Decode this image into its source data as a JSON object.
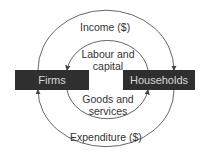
{
  "diagram": {
    "nodes": [
      {
        "id": "firms",
        "label": "Firms"
      },
      {
        "id": "households",
        "label": "Households"
      }
    ],
    "flows": [
      {
        "label": "Income ($)",
        "from": "firms",
        "to": "households",
        "position": "outer-top"
      },
      {
        "label_line1": "Labour and",
        "label_line2": "capital",
        "from": "households",
        "to": "firms",
        "position": "inner-top"
      },
      {
        "label_line1": "Goods and",
        "label_line2": "services",
        "from": "firms",
        "to": "households",
        "position": "inner-bottom"
      },
      {
        "label": "Expenditure ($)",
        "from": "households",
        "to": "firms",
        "position": "outer-bottom"
      }
    ],
    "colors": {
      "box": "#2f2f2f",
      "box_text": "#d8d8d8",
      "line": "#555555",
      "text": "#333333"
    }
  }
}
